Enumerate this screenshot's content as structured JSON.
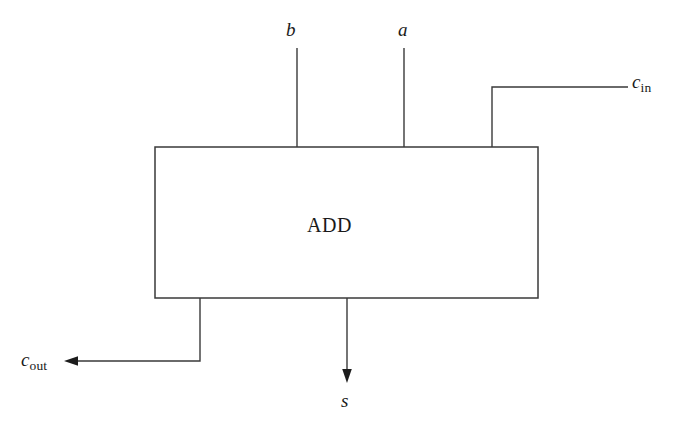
{
  "diagram": {
    "block": {
      "label": "ADD",
      "x": 155,
      "y": 147,
      "width": 383,
      "height": 151
    },
    "colors": {
      "background": "#ffffff",
      "wire": "#3a3a3a",
      "text": "#1a1a1a",
      "arrowhead": "#1c1c1c"
    },
    "inputs": [
      {
        "id": "b",
        "label": "b",
        "label_base": "b",
        "label_sub": "",
        "port_x": 297,
        "wire_top_y": 48,
        "wire_bottom_y": 147
      },
      {
        "id": "a",
        "label": "a",
        "label_base": "a",
        "label_sub": "",
        "port_x": 404,
        "wire_top_y": 48,
        "wire_bottom_y": 147
      },
      {
        "id": "c_in",
        "label": "c_in",
        "label_base": "c",
        "label_sub": "in",
        "port_x": 492,
        "elbow_y": 87,
        "wire_right_x": 628
      }
    ],
    "outputs": [
      {
        "id": "c_out",
        "label": "c_out",
        "label_base": "c",
        "label_sub": "out",
        "port_x": 200,
        "elbow_y": 361,
        "arrow_tip_x": 64,
        "arrow_direction": "left"
      },
      {
        "id": "s",
        "label": "s",
        "label_base": "s",
        "label_sub": "",
        "port_x": 347,
        "arrow_tip_y": 382,
        "arrow_direction": "down"
      }
    ]
  }
}
